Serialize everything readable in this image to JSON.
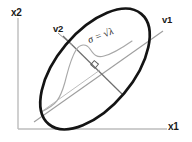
{
  "figure": {
    "background_color": "#ffffff"
  },
  "axes": {
    "color": "#b8b8b8",
    "x_axis": {
      "name": "x1",
      "label": "x1",
      "label_color": "#1a1a1a"
    },
    "y_axis": {
      "name": "x2",
      "label": "x2",
      "label_color": "#1a1a1a"
    }
  },
  "annotations": {
    "eigenvector_1": {
      "label": "v1",
      "description": "major-axis eigenvector direction"
    },
    "eigenvector_2": {
      "label": "v2",
      "description": "minor-axis eigenvector direction"
    },
    "sigma": {
      "symbol": "σ",
      "equals": "=",
      "radical": "√",
      "lambda": "λ",
      "label": "σ = √λ"
    },
    "right_angle": {
      "label": "right-angle-marker"
    }
  },
  "shapes": {
    "ellipse": {
      "stroke_color": "#111111",
      "stroke_width": 2.6,
      "rotation_deg": -50,
      "center_x": 95,
      "center_y": 69,
      "radius_major": 72,
      "radius_minor": 38
    },
    "principal_axis_v1": {
      "stroke_color": "#9a9a9a",
      "stroke_width": 1.1
    },
    "principal_axis_v2": {
      "stroke_color": "#6e6e6e",
      "stroke_width": 1.1
    },
    "gaussian_curve": {
      "stroke_color": "#a5a5a5",
      "stroke_width": 1.1
    },
    "leader_line_v2": {
      "stroke_color": "#8a8a8a",
      "stroke_width": 1.0
    }
  }
}
